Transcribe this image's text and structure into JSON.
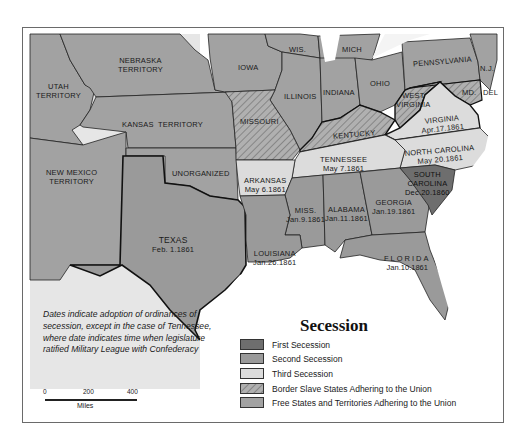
{
  "map": {
    "title": "Secession",
    "colors": {
      "first_secession": "#6e6e6e",
      "second_secession": "#9a9a9a",
      "third_secession": "#dcdcdc",
      "border_slave": "#a8a8a8",
      "free_states": "#a2a2a2",
      "water": "#ffffff",
      "mexico": "#e6e6e6",
      "border_line": "#111111"
    },
    "regions": {
      "nebraska": "NEBRASKA\nTERRITORY",
      "utah": "UTAH\nTERRITORY",
      "kansas": "KANSAS  TERRITORY",
      "new_mexico": "NEW MEXICO\nTERRITORY",
      "unorganized": "UNORGANIZED",
      "iowa": "IOWA",
      "wis": "WIS.",
      "mich": "MICH",
      "illinois": "ILLINOIS",
      "indiana": "INDIANA",
      "ohio": "OHIO",
      "pennsylvania": "PENNSYLVANIA",
      "nj": "N.J.",
      "md": "MD.",
      "del": "DEL",
      "missouri": "MISSOURI",
      "kentucky": "KENTUCKY",
      "west_virginia": "WEST\nVIRGINIA",
      "virginia": {
        "name": "VIRGINIA",
        "date": "Apr.17.1861"
      },
      "north_carolina": {
        "name": "NORTH CAROLINA",
        "date": "May 20.1861"
      },
      "tennessee": {
        "name": "TENNESSEE",
        "date": "May 7.1861"
      },
      "arkansas": {
        "name": "ARKANSAS",
        "date": "May 6.1861"
      },
      "south_carolina": {
        "name": "SOUTH\nCAROLINA",
        "date": "Dec.20.1860"
      },
      "georgia": {
        "name": "GEORGIA",
        "date": "Jan.19.1861"
      },
      "alabama": {
        "name": "ALABAMA",
        "date": "Jan.11.1861"
      },
      "mississippi": {
        "name": "MISS.",
        "date": "Jan.9.1861"
      },
      "louisiana": {
        "name": "LOUISIANA",
        "date": "Jan.26.1861"
      },
      "florida": {
        "name": "FLORIDA",
        "date": "Jan.10.1861"
      },
      "texas": {
        "name": "TEXAS",
        "date": "Feb. 1.1861"
      }
    },
    "note": "Dates indicate adoption of ordinances of secession, except in the case of Tennessee, where date indicates time when legislature ratified Military League with Confederacy",
    "scale": {
      "ticks": [
        "0",
        "200",
        "400"
      ],
      "unit": "Miles"
    },
    "legend": [
      {
        "label": "First Secession",
        "key": "first_secession"
      },
      {
        "label": "Second Secession",
        "key": "second_secession"
      },
      {
        "label": "Third Secession",
        "key": "third_secession"
      },
      {
        "label": "Border Slave States Adhering to the Union",
        "key": "border_slave"
      },
      {
        "label": "Free States and Territories Adhering to the Union",
        "key": "free_states"
      }
    ]
  }
}
